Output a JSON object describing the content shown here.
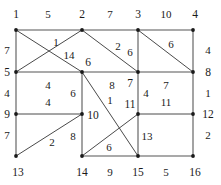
{
  "figure": {
    "type": "graph-diagram",
    "width": 221,
    "height": 185,
    "background_color": "#ffffff",
    "edge_color": "#4a4a4a",
    "vertex_color": "#1a1a1a",
    "text_color": "#1a1a1a"
  },
  "graph_data": {
    "type": "node-link-diagram",
    "layout": "4x4 grid with diagonals",
    "vertex_count": 16,
    "edge_count": 28,
    "vertices": [
      {
        "id": "v1",
        "label": "1",
        "x": 16,
        "y": 30,
        "label_x": 16,
        "label_y": 14
      },
      {
        "id": "v2",
        "label": "2",
        "x": 82,
        "y": 30,
        "label_x": 82,
        "label_y": 14
      },
      {
        "id": "v3",
        "label": "3",
        "x": 138,
        "y": 30,
        "label_x": 138,
        "label_y": 14
      },
      {
        "id": "v4",
        "label": "4",
        "x": 193,
        "y": 30,
        "label_x": 195,
        "label_y": 14
      },
      {
        "id": "v5",
        "label": "5",
        "x": 16,
        "y": 72,
        "label_x": 7,
        "label_y": 72
      },
      {
        "id": "v6",
        "label": "6",
        "x": 82,
        "y": 72,
        "label_x": 88,
        "label_y": 62
      },
      {
        "id": "v7",
        "label": "7",
        "x": 138,
        "y": 72,
        "label_x": 130,
        "label_y": 83
      },
      {
        "id": "v8",
        "label": "8",
        "x": 193,
        "y": 72,
        "label_x": 208,
        "label_y": 72
      },
      {
        "id": "v9",
        "label": "9",
        "x": 16,
        "y": 114,
        "label_x": 7,
        "label_y": 114
      },
      {
        "id": "v10",
        "label": "10",
        "x": 82,
        "y": 114,
        "label_x": 93,
        "label_y": 115
      },
      {
        "id": "v11",
        "label": "11",
        "x": 138,
        "y": 114,
        "label_x": 130,
        "label_y": 104
      },
      {
        "id": "v12",
        "label": "12",
        "x": 193,
        "y": 114,
        "label_x": 208,
        "label_y": 114
      },
      {
        "id": "v13",
        "label": "13",
        "x": 16,
        "y": 156,
        "label_x": 18,
        "label_y": 172
      },
      {
        "id": "v14",
        "label": "14",
        "x": 82,
        "y": 156,
        "label_x": 82,
        "label_y": 172
      },
      {
        "id": "v15",
        "label": "15",
        "x": 138,
        "y": 156,
        "label_x": 138,
        "label_y": 172
      },
      {
        "id": "v16",
        "label": "16",
        "x": 193,
        "y": 156,
        "label_x": 195,
        "label_y": 172
      }
    ],
    "edges": [
      {
        "id": "e1",
        "source": "v1",
        "target": "v2",
        "weight": "5",
        "x1": 16,
        "y1": 30,
        "x2": 82,
        "y2": 30,
        "label_x": 48,
        "label_y": 14,
        "thick": true
      },
      {
        "id": "e2",
        "source": "v2",
        "target": "v3",
        "weight": "7",
        "x1": 82,
        "y1": 30,
        "x2": 138,
        "y2": 30,
        "label_x": 110,
        "label_y": 14,
        "thick": true
      },
      {
        "id": "e3",
        "source": "v3",
        "target": "v4",
        "weight": "10",
        "x1": 138,
        "y1": 30,
        "x2": 193,
        "y2": 30,
        "label_x": 166,
        "label_y": 14,
        "thick": true
      },
      {
        "id": "e4",
        "source": "v5",
        "target": "v6",
        "weight": "4",
        "x1": 16,
        "y1": 72,
        "x2": 82,
        "y2": 72,
        "label_x": 48,
        "label_y": 85,
        "thick": true
      },
      {
        "id": "e5",
        "source": "v6",
        "target": "v7",
        "weight": "8",
        "x1": 82,
        "y1": 72,
        "x2": 138,
        "y2": 72,
        "label_x": 112,
        "label_y": 85,
        "thick": true
      },
      {
        "id": "e6",
        "source": "v7",
        "target": "v8",
        "weight": "7",
        "x1": 138,
        "y1": 72,
        "x2": 193,
        "y2": 72,
        "label_x": 166,
        "label_y": 85,
        "thick": true
      },
      {
        "id": "e7",
        "source": "v9",
        "target": "v10",
        "weight": "4",
        "x1": 16,
        "y1": 114,
        "x2": 82,
        "y2": 114,
        "label_x": 48,
        "label_y": 102,
        "thick": false
      },
      {
        "id": "e8",
        "source": "v11",
        "target": "v12",
        "weight": "11",
        "x1": 138,
        "y1": 114,
        "x2": 193,
        "y2": 114,
        "label_x": 166,
        "label_y": 102,
        "thick": false
      },
      {
        "id": "e9",
        "source": "v14",
        "target": "v15",
        "weight": "9",
        "x1": 82,
        "y1": 156,
        "x2": 138,
        "y2": 156,
        "label_x": 110,
        "label_y": 172,
        "thick": true
      },
      {
        "id": "e10",
        "source": "v15",
        "target": "v16",
        "weight": "5",
        "x1": 138,
        "y1": 156,
        "x2": 193,
        "y2": 156,
        "label_x": 166,
        "label_y": 172,
        "thick": true
      },
      {
        "id": "e11",
        "source": "v1",
        "target": "v5",
        "weight": "7",
        "x1": 16,
        "y1": 30,
        "x2": 16,
        "y2": 72,
        "label_x": 7,
        "label_y": 50,
        "thick": true
      },
      {
        "id": "e12",
        "source": "v5",
        "target": "v9",
        "weight": "4",
        "x1": 16,
        "y1": 72,
        "x2": 16,
        "y2": 114,
        "label_x": 7,
        "label_y": 93,
        "thick": true
      },
      {
        "id": "e13",
        "source": "v9",
        "target": "v13",
        "weight": "7",
        "x1": 16,
        "y1": 114,
        "x2": 16,
        "y2": 156,
        "label_x": 7,
        "label_y": 135,
        "thick": true
      },
      {
        "id": "e14",
        "source": "v6",
        "target": "v10",
        "weight": "6",
        "x1": 82,
        "y1": 72,
        "x2": 82,
        "y2": 114,
        "label_x": 73,
        "label_y": 93,
        "thick": true
      },
      {
        "id": "e15",
        "source": "v10",
        "target": "v14",
        "weight": "8",
        "x1": 82,
        "y1": 114,
        "x2": 82,
        "y2": 156,
        "label_x": 73,
        "label_y": 136,
        "thick": true
      },
      {
        "id": "e16",
        "source": "v3",
        "target": "v7",
        "weight": "6",
        "x1": 138,
        "y1": 30,
        "x2": 138,
        "y2": 72,
        "label_x": 130,
        "label_y": 52,
        "thick": true
      },
      {
        "id": "e17",
        "source": "v7",
        "target": "v11",
        "weight": "4",
        "x1": 138,
        "y1": 72,
        "x2": 138,
        "y2": 114,
        "label_x": 146,
        "label_y": 93,
        "thick": true
      },
      {
        "id": "e18",
        "source": "v11",
        "target": "v15",
        "weight": "13",
        "x1": 138,
        "y1": 114,
        "x2": 138,
        "y2": 156,
        "label_x": 147,
        "label_y": 136,
        "thick": true
      },
      {
        "id": "e19",
        "source": "v4",
        "target": "v8",
        "weight": "4",
        "x1": 193,
        "y1": 30,
        "x2": 193,
        "y2": 72,
        "label_x": 208,
        "label_y": 50,
        "thick": true
      },
      {
        "id": "e20",
        "source": "v8",
        "target": "v12",
        "weight": "1",
        "x1": 193,
        "y1": 72,
        "x2": 193,
        "y2": 114,
        "label_x": 208,
        "label_y": 93,
        "thick": true
      },
      {
        "id": "e21",
        "source": "v12",
        "target": "v16",
        "weight": "2",
        "x1": 193,
        "y1": 114,
        "x2": 193,
        "y2": 156,
        "label_x": 208,
        "label_y": 135,
        "thick": true
      },
      {
        "id": "e22",
        "source": "v1",
        "target": "v6",
        "weight": "1",
        "x1": 16,
        "y1": 30,
        "x2": 82,
        "y2": 72,
        "label_x": 56,
        "label_y": 42,
        "thick": false
      },
      {
        "id": "e23",
        "source": "v2",
        "target": "v5",
        "weight": "14",
        "x1": 82,
        "y1": 30,
        "x2": 16,
        "y2": 72,
        "label_x": 69,
        "label_y": 55,
        "thick": false
      },
      {
        "id": "e24",
        "source": "v2",
        "target": "v7",
        "weight": "2",
        "x1": 82,
        "y1": 30,
        "x2": 138,
        "y2": 72,
        "label_x": 118,
        "label_y": 46,
        "thick": false
      },
      {
        "id": "e25",
        "source": "v3",
        "target": "v8",
        "weight": "6",
        "x1": 138,
        "y1": 30,
        "x2": 193,
        "y2": 72,
        "label_x": 171,
        "label_y": 44,
        "thick": false
      },
      {
        "id": "e26",
        "source": "v6",
        "target": "v15",
        "weight": "1",
        "x1": 82,
        "y1": 72,
        "x2": 138,
        "y2": 156,
        "label_x": 110,
        "label_y": 100,
        "thick": false
      },
      {
        "id": "e27",
        "source": "v11",
        "target": "v14",
        "weight": "6",
        "x1": 138,
        "y1": 114,
        "x2": 82,
        "y2": 156,
        "label_x": 109,
        "label_y": 147,
        "thick": false
      },
      {
        "id": "e28",
        "source": "v13",
        "target": "v10",
        "weight": "2",
        "x1": 16,
        "y1": 156,
        "x2": 82,
        "y2": 114,
        "label_x": 52,
        "label_y": 142,
        "thick": false
      }
    ]
  }
}
